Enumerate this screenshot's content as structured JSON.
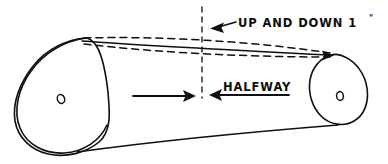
{
  "diagram": {
    "annotations": {
      "deflection_label": "UP AND DOWN 1\"",
      "deflection_text": "UP AND DOWN 1",
      "deflection_unit": "\"",
      "midpoint_label": "HALFWAY"
    },
    "parts": {
      "large_pulley_name": "large-pulley",
      "small_pulley_name": "small-pulley",
      "belt_name": "drive-belt"
    },
    "geometry": {
      "large_pulley": {
        "cx": 61,
        "cy": 99,
        "r": 48,
        "hub_rx": 3.6,
        "hub_ry": 4.6
      },
      "small_pulley": {
        "cx": 341,
        "cy": 96,
        "r": 26,
        "hub_rx": 3.4,
        "hub_ry": 4.4
      },
      "centerline_x": 202,
      "centerline_top": 7,
      "centerline_bottom": 98
    },
    "measurements": {
      "deflection_amount": "1",
      "deflection_units": "inch",
      "deflection_direction": "up and down",
      "measure_location": "halfway"
    },
    "colors": {
      "ink": "#101010",
      "paper": "#ffffff"
    }
  }
}
